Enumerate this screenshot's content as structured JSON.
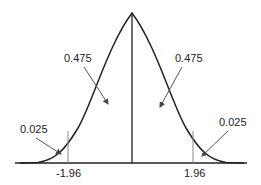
{
  "diagram": {
    "areas": {
      "left_center": "0.475",
      "right_center": "0.475",
      "left_tail": "0.025",
      "right_tail": "0.025"
    },
    "axis_ticks": {
      "left": "-1.96",
      "right": "1.96"
    },
    "colors": {
      "curve": "#222222",
      "bounds": "#888888",
      "arrows": "#555555"
    }
  }
}
